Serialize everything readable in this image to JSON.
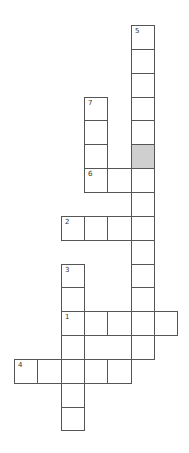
{
  "puzzle": {
    "type": "crossword",
    "grid": {
      "origin_x": 14,
      "origin_y": 25,
      "cell_w": 23.3,
      "cell_h": 23.85,
      "border_color": "#555555",
      "shaded_color": "#cfcfcf"
    },
    "cells": [
      {
        "c": 5,
        "r": 0,
        "num": "5"
      },
      {
        "c": 5,
        "r": 1
      },
      {
        "c": 5,
        "r": 2
      },
      {
        "c": 3,
        "r": 3,
        "num": "7"
      },
      {
        "c": 5,
        "r": 3
      },
      {
        "c": 3,
        "r": 4
      },
      {
        "c": 5,
        "r": 4
      },
      {
        "c": 3,
        "r": 5
      },
      {
        "c": 5,
        "r": 5,
        "shaded": true
      },
      {
        "c": 3,
        "r": 6,
        "num": "6"
      },
      {
        "c": 4,
        "r": 6
      },
      {
        "c": 5,
        "r": 6
      },
      {
        "c": 5,
        "r": 7
      },
      {
        "c": 2,
        "r": 8,
        "num": "2"
      },
      {
        "c": 3,
        "r": 8
      },
      {
        "c": 4,
        "r": 8
      },
      {
        "c": 5,
        "r": 8
      },
      {
        "c": 5,
        "r": 9
      },
      {
        "c": 2,
        "r": 10,
        "num": "3"
      },
      {
        "c": 5,
        "r": 10
      },
      {
        "c": 2,
        "r": 11
      },
      {
        "c": 5,
        "r": 11
      },
      {
        "c": 2,
        "r": 12,
        "num": "1"
      },
      {
        "c": 3,
        "r": 12
      },
      {
        "c": 4,
        "r": 12
      },
      {
        "c": 5,
        "r": 12
      },
      {
        "c": 6,
        "r": 12
      },
      {
        "c": 2,
        "r": 13
      },
      {
        "c": 5,
        "r": 13
      },
      {
        "c": 0,
        "r": 14,
        "num": "4"
      },
      {
        "c": 1,
        "r": 14
      },
      {
        "c": 2,
        "r": 14
      },
      {
        "c": 3,
        "r": 14
      },
      {
        "c": 4,
        "r": 14
      },
      {
        "c": 2,
        "r": 15
      },
      {
        "c": 2,
        "r": 16
      }
    ],
    "entries": [
      {
        "number": "1",
        "direction": "across",
        "length": 5
      },
      {
        "number": "2",
        "direction": "across",
        "length": 4
      },
      {
        "number": "3",
        "direction": "down",
        "length": 7
      },
      {
        "number": "4",
        "direction": "across",
        "length": 5
      },
      {
        "number": "5",
        "direction": "down",
        "length": 14
      },
      {
        "number": "6",
        "direction": "across",
        "length": 3
      },
      {
        "number": "7",
        "direction": "down",
        "length": 4
      }
    ]
  }
}
